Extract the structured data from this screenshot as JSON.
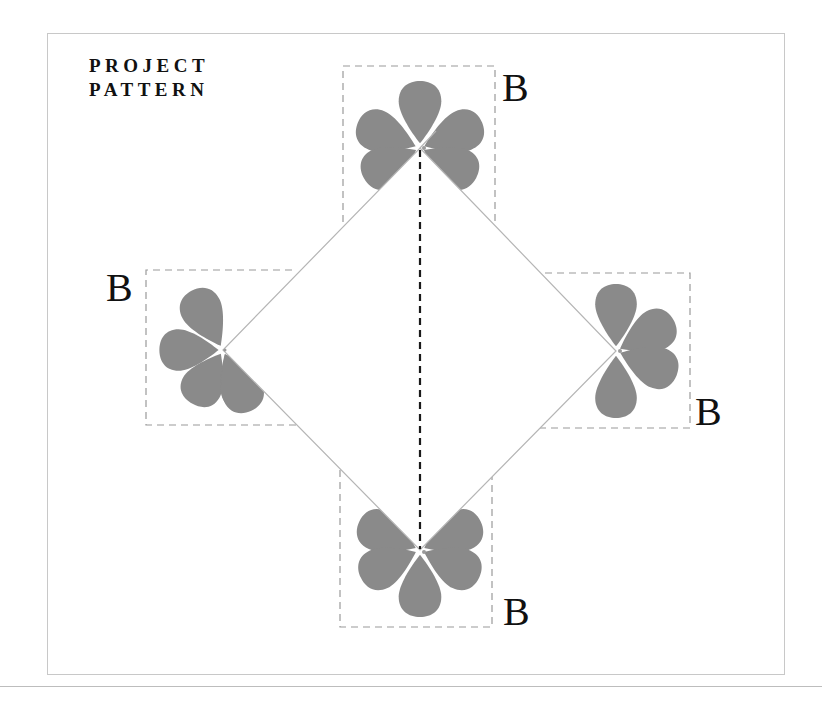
{
  "title": {
    "line1": "PROJECT",
    "line2": "PATTERN"
  },
  "labels": {
    "top": "B",
    "left": "B",
    "right": "B",
    "bottom": "B"
  },
  "colors": {
    "petal": "#8a8a8a",
    "dashed_box": "#9a9a9a",
    "diamond_edge": "#b5b5b5",
    "fold_line": "#1a1a1a",
    "frame": "#c8c8c8",
    "text": "#111111"
  },
  "diagram": {
    "diamond_vertices": {
      "top": [
        420,
        148
      ],
      "left": [
        223,
        350
      ],
      "right": [
        616,
        351
      ],
      "bottom": [
        420,
        550
      ]
    },
    "flower_petals": 5,
    "fold_line": "vertical dashed, top vertex to bottom vertex"
  }
}
